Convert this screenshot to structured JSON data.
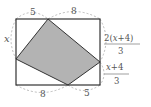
{
  "diagram": {
    "type": "geometry",
    "colors": {
      "rect": "#333333",
      "shade": "#b3b3b3",
      "arc": "#aaaaaa",
      "text": "#555555"
    },
    "labels": {
      "top_left": "5",
      "top_right": "8",
      "left": "x",
      "right_upper_num": "2(x+4)",
      "right_upper_den": "3",
      "right_lower_num": "x+4",
      "right_lower_den": "3",
      "bottom_left": "8",
      "bottom_right": "5"
    }
  }
}
